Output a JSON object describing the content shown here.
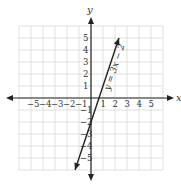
{
  "chart_data": {
    "type": "line",
    "title": "",
    "xlabel": "x",
    "ylabel": "y",
    "xlim": [
      -6,
      6
    ],
    "ylim": [
      -6,
      6
    ],
    "grid": true,
    "x_ticks": [
      "-5",
      "-4",
      "-3",
      "-2",
      "-1",
      "1",
      "2",
      "3",
      "4",
      "5"
    ],
    "y_ticks": [
      "5",
      "4",
      "3",
      "2",
      "1",
      "-1",
      "-2",
      "-3",
      "-4",
      "-5"
    ],
    "series": [
      {
        "name": "y = 3x − 2",
        "equation": "y = 3x − 2",
        "x": [
          -1.33,
          2.33
        ],
        "y": [
          -6,
          5
        ],
        "arrows": "both"
      }
    ],
    "annotations": [
      {
        "text": "y = 3x − 2",
        "rotation": "along line"
      }
    ]
  }
}
